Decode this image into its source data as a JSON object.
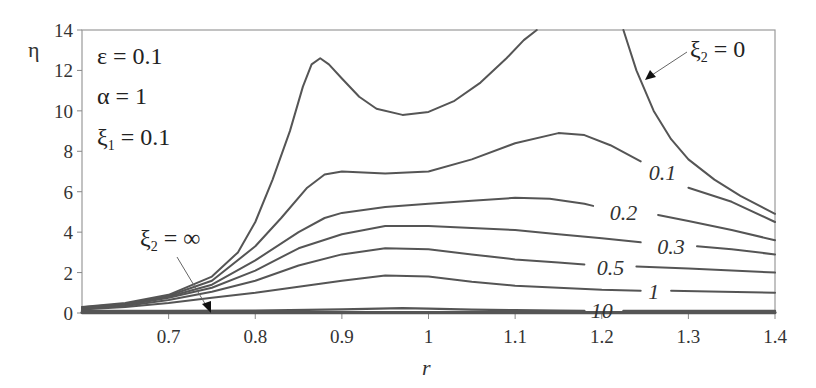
{
  "chart_data": {
    "type": "line",
    "title": "",
    "xlabel": "r",
    "ylabel": "η",
    "xlim": [
      0.6,
      1.4
    ],
    "ylim": [
      0,
      14
    ],
    "grid": false,
    "x_ticks": [
      "0.7",
      "0.8",
      "0.9",
      "1",
      "1.1",
      "1.2",
      "1.3",
      "1.4"
    ],
    "x_tick_values": [
      0.7,
      0.8,
      0.9,
      1.0,
      1.1,
      1.2,
      1.3,
      1.4
    ],
    "y_ticks": [
      "0",
      "2",
      "4",
      "6",
      "8",
      "10",
      "12",
      "14"
    ],
    "y_tick_values": [
      0,
      2,
      4,
      6,
      8,
      10,
      12,
      14
    ],
    "parameters": [
      "ε = 0.1",
      "α = 1",
      "ξ₁ = 0.1"
    ],
    "annotations": [
      {
        "text": "ξ₂ = 0",
        "target_series": "0"
      },
      {
        "text": "ξ₂ = ∞",
        "target_series": "inf"
      }
    ],
    "series": [
      {
        "name": "0",
        "label": "",
        "segments": [
          [
            [
              0.6,
              0.3
            ],
            [
              0.65,
              0.5
            ],
            [
              0.7,
              0.9
            ],
            [
              0.75,
              1.8
            ],
            [
              0.78,
              3.0
            ],
            [
              0.8,
              4.5
            ],
            [
              0.82,
              6.6
            ],
            [
              0.84,
              9.0
            ],
            [
              0.855,
              11.2
            ],
            [
              0.865,
              12.3
            ],
            [
              0.875,
              12.6
            ],
            [
              0.885,
              12.3
            ],
            [
              0.9,
              11.6
            ],
            [
              0.92,
              10.7
            ],
            [
              0.94,
              10.1
            ],
            [
              0.97,
              9.8
            ],
            [
              1.0,
              9.95
            ],
            [
              1.03,
              10.5
            ],
            [
              1.06,
              11.4
            ],
            [
              1.09,
              12.6
            ],
            [
              1.11,
              13.5
            ],
            [
              1.125,
              14.0
            ]
          ],
          [
            [
              1.225,
              14.0
            ],
            [
              1.24,
              12.0
            ],
            [
              1.26,
              10.0
            ],
            [
              1.28,
              8.6
            ],
            [
              1.3,
              7.6
            ],
            [
              1.33,
              6.6
            ],
            [
              1.36,
              5.8
            ],
            [
              1.4,
              4.9
            ]
          ]
        ]
      },
      {
        "name": "0.1",
        "label": "0.1",
        "label_pos": [
          1.27,
          7.0
        ],
        "segments": [
          [
            [
              0.6,
              0.28
            ],
            [
              0.65,
              0.45
            ],
            [
              0.7,
              0.85
            ],
            [
              0.75,
              1.6
            ],
            [
              0.8,
              3.3
            ],
            [
              0.83,
              4.7
            ],
            [
              0.86,
              6.2
            ],
            [
              0.88,
              6.85
            ],
            [
              0.9,
              7.0
            ],
            [
              0.95,
              6.9
            ],
            [
              1.0,
              7.0
            ],
            [
              1.05,
              7.6
            ],
            [
              1.1,
              8.4
            ],
            [
              1.15,
              8.9
            ],
            [
              1.18,
              8.8
            ],
            [
              1.21,
              8.3
            ],
            [
              1.245,
              7.5
            ]
          ],
          [
            [
              1.3,
              6.2
            ],
            [
              1.35,
              5.5
            ],
            [
              1.4,
              4.5
            ]
          ]
        ]
      },
      {
        "name": "0.2",
        "label": "0.2",
        "label_pos": [
          1.225,
          5.0
        ],
        "segments": [
          [
            [
              0.6,
              0.26
            ],
            [
              0.65,
              0.42
            ],
            [
              0.7,
              0.8
            ],
            [
              0.75,
              1.4
            ],
            [
              0.8,
              2.6
            ],
            [
              0.85,
              4.0
            ],
            [
              0.88,
              4.7
            ],
            [
              0.9,
              4.95
            ],
            [
              0.95,
              5.25
            ],
            [
              1.0,
              5.4
            ],
            [
              1.05,
              5.55
            ],
            [
              1.1,
              5.7
            ],
            [
              1.14,
              5.65
            ],
            [
              1.18,
              5.4
            ],
            [
              1.19,
              5.3
            ]
          ],
          [
            [
              1.265,
              4.85
            ],
            [
              1.3,
              4.55
            ],
            [
              1.35,
              4.1
            ],
            [
              1.4,
              3.6
            ]
          ]
        ]
      },
      {
        "name": "0.3",
        "label": "0.3",
        "label_pos": [
          1.28,
          3.3
        ],
        "segments": [
          [
            [
              0.6,
              0.24
            ],
            [
              0.65,
              0.38
            ],
            [
              0.7,
              0.75
            ],
            [
              0.75,
              1.25
            ],
            [
              0.8,
              2.1
            ],
            [
              0.85,
              3.2
            ],
            [
              0.9,
              3.9
            ],
            [
              0.95,
              4.3
            ],
            [
              1.0,
              4.3
            ],
            [
              1.05,
              4.2
            ],
            [
              1.1,
              4.1
            ],
            [
              1.15,
              3.9
            ],
            [
              1.2,
              3.7
            ],
            [
              1.245,
              3.5
            ]
          ],
          [
            [
              1.31,
              3.3
            ],
            [
              1.35,
              3.15
            ],
            [
              1.4,
              2.9
            ]
          ]
        ]
      },
      {
        "name": "0.5",
        "label": "0.5",
        "label_pos": [
          1.21,
          2.3
        ],
        "segments": [
          [
            [
              0.6,
              0.22
            ],
            [
              0.65,
              0.35
            ],
            [
              0.7,
              0.65
            ],
            [
              0.75,
              1.05
            ],
            [
              0.8,
              1.6
            ],
            [
              0.85,
              2.35
            ],
            [
              0.9,
              2.9
            ],
            [
              0.95,
              3.2
            ],
            [
              1.0,
              3.15
            ],
            [
              1.05,
              2.9
            ],
            [
              1.1,
              2.65
            ],
            [
              1.15,
              2.5
            ],
            [
              1.18,
              2.4
            ]
          ],
          [
            [
              1.24,
              2.3
            ],
            [
              1.3,
              2.2
            ],
            [
              1.35,
              2.1
            ],
            [
              1.4,
              2.0
            ]
          ]
        ]
      },
      {
        "name": "1",
        "label": "1",
        "label_pos": [
          1.26,
          1.1
        ],
        "segments": [
          [
            [
              0.6,
              0.18
            ],
            [
              0.65,
              0.3
            ],
            [
              0.7,
              0.5
            ],
            [
              0.75,
              0.75
            ],
            [
              0.8,
              1.0
            ],
            [
              0.85,
              1.3
            ],
            [
              0.9,
              1.6
            ],
            [
              0.95,
              1.85
            ],
            [
              1.0,
              1.8
            ],
            [
              1.05,
              1.55
            ],
            [
              1.1,
              1.35
            ],
            [
              1.15,
              1.25
            ],
            [
              1.2,
              1.15
            ],
            [
              1.245,
              1.1
            ]
          ],
          [
            [
              1.28,
              1.1
            ],
            [
              1.34,
              1.05
            ],
            [
              1.4,
              1.0
            ]
          ]
        ]
      },
      {
        "name": "10",
        "label": "10",
        "label_pos": [
          1.2,
          0.15
        ],
        "segments": [
          [
            [
              0.6,
              0.1
            ],
            [
              0.7,
              0.1
            ],
            [
              0.8,
              0.12
            ],
            [
              0.9,
              0.18
            ],
            [
              0.97,
              0.24
            ],
            [
              1.0,
              0.22
            ],
            [
              1.05,
              0.17
            ],
            [
              1.1,
              0.14
            ],
            [
              1.15,
              0.11
            ],
            [
              1.18,
              0.1
            ]
          ],
          [
            [
              1.225,
              0.1
            ],
            [
              1.3,
              0.1
            ],
            [
              1.4,
              0.1
            ]
          ]
        ]
      },
      {
        "name": "inf",
        "label": "",
        "segments": [
          [
            [
              0.6,
              0.02
            ],
            [
              1.0,
              0.02
            ],
            [
              1.4,
              0.02
            ]
          ]
        ]
      }
    ]
  },
  "labels": {
    "ylabel": "η",
    "xlabel": "r",
    "param_eps": "ε = 0.1",
    "param_alpha": "α = 1",
    "param_xi1_base": "ξ",
    "param_xi1_sub": "1",
    "param_xi1_rest": " = 0.1",
    "annot_zero_base": "ξ",
    "annot_zero_sub": "2",
    "annot_zero_rest": " = 0",
    "annot_inf_base": "ξ",
    "annot_inf_sub": "2",
    "annot_inf_rest": " = ∞"
  }
}
